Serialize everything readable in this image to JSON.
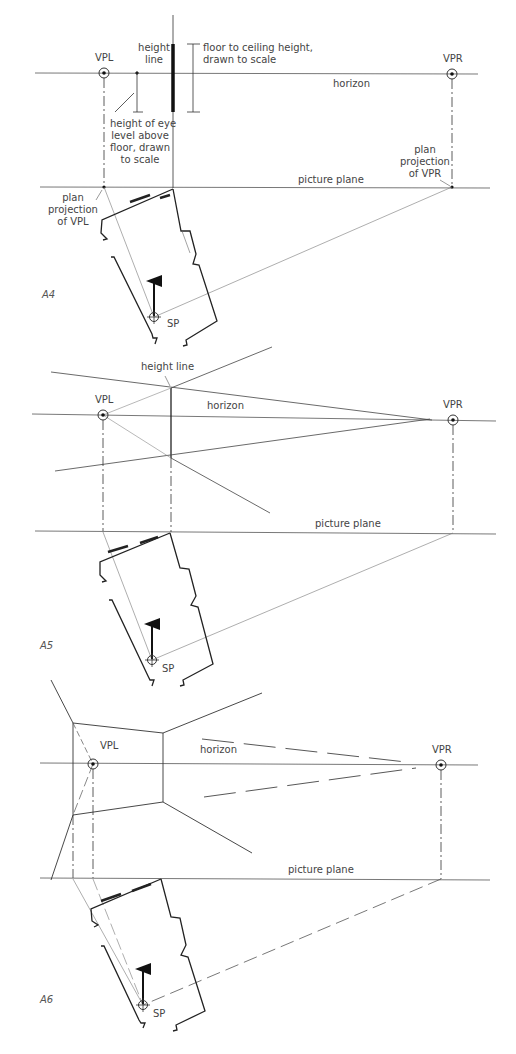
{
  "figures": [
    {
      "id": "A4",
      "label": "A4",
      "labels": {
        "vpl": "VPL",
        "vpr": "VPR",
        "height_line": [
          "height",
          "line"
        ],
        "floor_ceiling": [
          "floor to ceiling height,",
          "drawn to scale"
        ],
        "horizon": "horizon",
        "eye_level": [
          "height of eye",
          "level above",
          "floor, drawn",
          "to scale"
        ],
        "plan_proj_vpl": [
          "plan",
          "projection",
          "of VPL"
        ],
        "plan_proj_vpr": [
          "plan",
          "projection",
          "of VPR"
        ],
        "picture_plane": "picture plane",
        "sp": "SP"
      }
    },
    {
      "id": "A5",
      "label": "A5",
      "labels": {
        "vpl": "VPL",
        "vpr": "VPR",
        "height_line": "height line",
        "horizon": "horizon",
        "picture_plane": "picture plane",
        "sp": "SP"
      }
    },
    {
      "id": "A6",
      "label": "A6",
      "labels": {
        "vpl": "VPL",
        "vpr": "VPR",
        "horizon": "horizon",
        "picture_plane": "picture plane",
        "sp": "SP"
      }
    }
  ],
  "colors": {
    "line": "#333333",
    "thin": "#666666",
    "text": "#444444",
    "background": "#ffffff"
  }
}
